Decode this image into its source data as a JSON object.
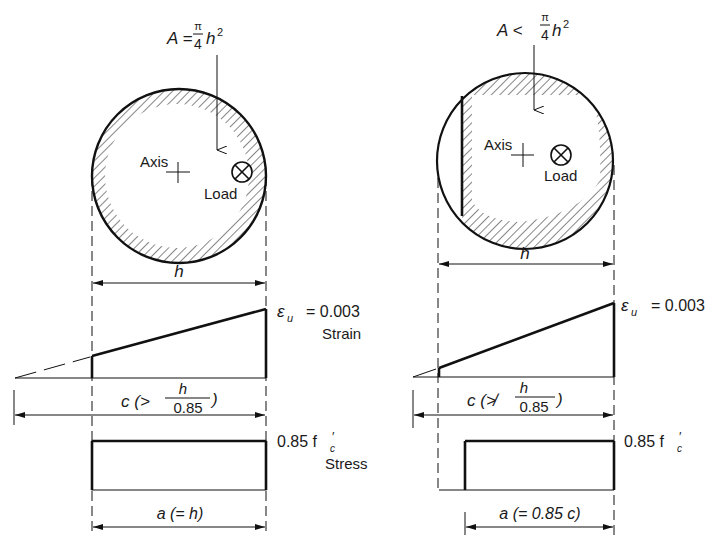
{
  "left": {
    "area_label": "A = π/4 h²",
    "area_prefix": "A =",
    "area_frac_num": "π",
    "area_frac_den": "4",
    "area_suffix": "h",
    "area_exp": "2",
    "axis_label": "Axis",
    "load_label": "Load",
    "width_label": "h",
    "strain_value": "= 0.003",
    "strain_symbol": "ε",
    "strain_sub": "u",
    "strain_caption": "Strain",
    "c_label_prefix": "c (>",
    "c_frac_num": "h",
    "c_frac_den": "0.85",
    "c_label_suffix": ")",
    "stress_value": "0.85 f",
    "stress_sub": "c",
    "stress_prime": "′",
    "stress_caption": "Stress",
    "a_label": "a (= h)"
  },
  "right": {
    "area_prefix": "A <",
    "area_frac_num": "π",
    "area_frac_den": "4",
    "area_suffix": "h",
    "area_exp": "2",
    "axis_label": "Axis",
    "load_label": "Load",
    "width_label": "h",
    "strain_symbol": "ε",
    "strain_sub": "u",
    "strain_value": "= 0.003",
    "c_label_prefix": "c (≯",
    "c_frac_num": "h",
    "c_frac_den": "0.85",
    "c_label_suffix": ")",
    "stress_value": "0.85 f",
    "stress_sub": "c",
    "stress_prime": "′",
    "a_label": "a (= 0.85 c)"
  },
  "icons": {
    "load": "circle-cross",
    "axis": "plus-cross"
  }
}
